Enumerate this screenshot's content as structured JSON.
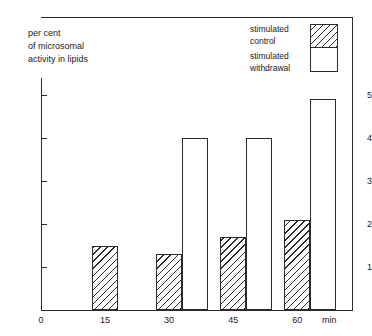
{
  "chart_data": {
    "type": "bar",
    "title": "",
    "subtitle": "",
    "ylabel": "per cent\nof microsomal\nactivity in lipids",
    "xlabel": "min",
    "categories": [
      "15",
      "30",
      "45",
      "60"
    ],
    "x_tick_labels": [
      "0",
      "15",
      "30",
      "45",
      "60"
    ],
    "y_tick_labels": [
      "1",
      "2",
      "3",
      "4",
      "5"
    ],
    "xlim": [
      0,
      75
    ],
    "ylim": [
      0,
      5.4
    ],
    "grid": false,
    "legend_position": "top-right",
    "series": [
      {
        "name": "stimulated control",
        "style": "hatched",
        "values": [
          1.5,
          1.3,
          1.7,
          2.1
        ]
      },
      {
        "name": "stimulated withdrawal",
        "style": "white",
        "values": [
          null,
          4.0,
          4.0,
          4.9
        ]
      }
    ],
    "legend_entries": [
      {
        "label": "stimulated\ncontrol",
        "style": "hatched"
      },
      {
        "label": "stimulated\nwithdrawal",
        "style": "white"
      }
    ]
  },
  "axis": {
    "y_title": "per cent\nof microsomal\nactivity in lipids",
    "x_unit": "min",
    "y_ticks": [
      {
        "label": "5",
        "value": 5
      },
      {
        "label": "4",
        "value": 4
      },
      {
        "label": "3",
        "value": 3
      },
      {
        "label": "2",
        "value": 2
      },
      {
        "label": "1",
        "value": 1
      }
    ],
    "x_ticks": [
      {
        "label": "0",
        "value": 0
      },
      {
        "label": "15",
        "value": 15
      },
      {
        "label": "30",
        "value": 30
      },
      {
        "label": "45",
        "value": 45
      },
      {
        "label": "60",
        "value": 60
      }
    ]
  },
  "legend": {
    "control_label": "stimulated\ncontrol",
    "withdrawal_label": "stimulated\nwithdrawal"
  },
  "colors": {
    "ink": "#2b2b2b",
    "text": "#1a1a1a",
    "background": "#ffffff"
  }
}
